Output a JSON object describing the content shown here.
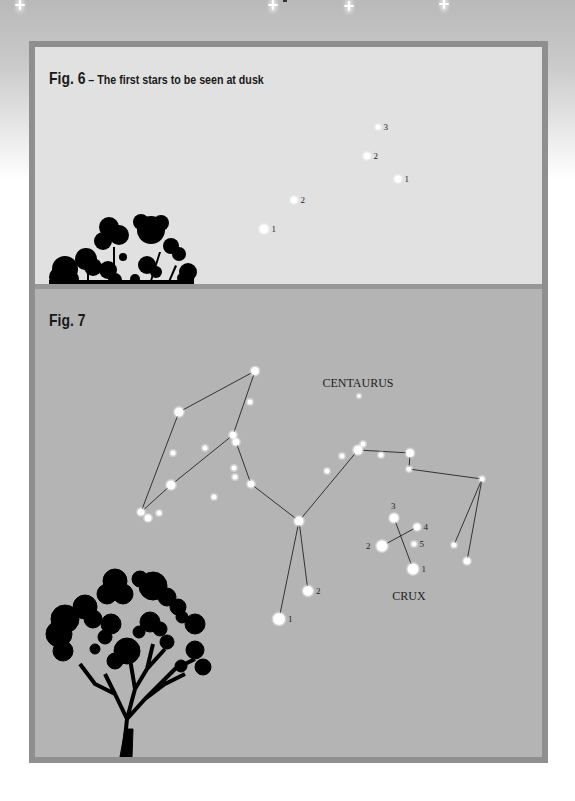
{
  "page": {
    "background_colors": {
      "top": "#b9b9b9",
      "bottom": "#ffffff"
    },
    "sparkles": [
      {
        "x": 15,
        "y": 0
      },
      {
        "x": 268,
        "y": 0
      },
      {
        "x": 344,
        "y": 1
      },
      {
        "x": 439,
        "y": -1
      }
    ]
  },
  "fig6": {
    "label": "Fig. 6",
    "separator": " – ",
    "subtitle": "The first stars to be seen at dusk",
    "fill": "#e1e1e1",
    "stars": [
      {
        "x": 229,
        "y": 182,
        "r": 4.5,
        "label": "1"
      },
      {
        "x": 259,
        "y": 153,
        "r": 3.5,
        "label": "2"
      },
      {
        "x": 332,
        "y": 109,
        "r": 3.5,
        "label": "2"
      },
      {
        "x": 363,
        "y": 132,
        "r": 3.5,
        "label": "1"
      },
      {
        "x": 343,
        "y": 80,
        "r": 2.5,
        "label": "3"
      }
    ]
  },
  "fig7": {
    "label": "Fig. 7",
    "fill": "#b4b4b4",
    "constellations": [
      {
        "name": "CENTAURUS",
        "label_x": 323,
        "label_y": 98
      },
      {
        "name": "CRUX",
        "label_x": 374,
        "label_y": 311
      }
    ],
    "stars": [
      {
        "x": 220,
        "y": 82,
        "r": 4
      },
      {
        "x": 144,
        "y": 123,
        "r": 4.5
      },
      {
        "x": 198,
        "y": 146,
        "r": 3.5
      },
      {
        "x": 201,
        "y": 153,
        "r": 3.5
      },
      {
        "x": 136,
        "y": 196,
        "r": 4.5
      },
      {
        "x": 106,
        "y": 223,
        "r": 3.5
      },
      {
        "x": 113,
        "y": 229,
        "r": 3.5
      },
      {
        "x": 124,
        "y": 224,
        "r": 2.5
      },
      {
        "x": 216,
        "y": 195,
        "r": 3.5
      },
      {
        "x": 264,
        "y": 232,
        "r": 4.5
      },
      {
        "x": 215,
        "y": 113,
        "r": 2.5
      },
      {
        "x": 138,
        "y": 164,
        "r": 2.5
      },
      {
        "x": 170,
        "y": 159,
        "r": 2.5
      },
      {
        "x": 199,
        "y": 179,
        "r": 2.5
      },
      {
        "x": 200,
        "y": 188,
        "r": 2.5
      },
      {
        "x": 179,
        "y": 208,
        "r": 2.5
      },
      {
        "x": 324,
        "y": 107,
        "r": 1.8
      },
      {
        "x": 323,
        "y": 161,
        "r": 4.5
      },
      {
        "x": 328,
        "y": 155,
        "r": 2.5
      },
      {
        "x": 375,
        "y": 164,
        "r": 4
      },
      {
        "x": 374,
        "y": 180,
        "r": 2.5
      },
      {
        "x": 447,
        "y": 190,
        "r": 2.5
      },
      {
        "x": 307,
        "y": 167,
        "r": 2.5
      },
      {
        "x": 346,
        "y": 166,
        "r": 2.5
      },
      {
        "x": 292,
        "y": 182,
        "r": 2.5
      },
      {
        "x": 419,
        "y": 256,
        "r": 2.5
      },
      {
        "x": 432,
        "y": 272,
        "r": 3.5
      },
      {
        "x": 273,
        "y": 302,
        "r": 5,
        "label": "2"
      },
      {
        "x": 244,
        "y": 330,
        "r": 6,
        "label": "1"
      },
      {
        "x": 359,
        "y": 229,
        "r": 4.5,
        "label": "3"
      },
      {
        "x": 382,
        "y": 238,
        "r": 3.5,
        "label": "4"
      },
      {
        "x": 347,
        "y": 257,
        "r": 5.5,
        "label": "2"
      },
      {
        "x": 379,
        "y": 255,
        "r": 2.5,
        "label": "5"
      },
      {
        "x": 378,
        "y": 280,
        "r": 5.5,
        "label": "1"
      }
    ],
    "lines": [
      [
        [
          220,
          82
        ],
        [
          144,
          123
        ],
        [
          106,
          223
        ]
      ],
      [
        [
          220,
          82
        ],
        [
          198,
          146
        ]
      ],
      [
        [
          198,
          146
        ],
        [
          136,
          196
        ],
        [
          106,
          223
        ]
      ],
      [
        [
          201,
          153
        ],
        [
          216,
          195
        ],
        [
          264,
          232
        ]
      ],
      [
        [
          264,
          232
        ],
        [
          323,
          161
        ],
        [
          375,
          164
        ],
        [
          374,
          180
        ],
        [
          447,
          190
        ]
      ],
      [
        [
          264,
          232
        ],
        [
          273,
          302
        ]
      ],
      [
        [
          264,
          232
        ],
        [
          244,
          330
        ]
      ],
      [
        [
          447,
          190
        ],
        [
          419,
          256
        ]
      ],
      [
        [
          447,
          190
        ],
        [
          432,
          272
        ]
      ],
      [
        [
          359,
          229
        ],
        [
          378,
          280
        ]
      ],
      [
        [
          347,
          257
        ],
        [
          382,
          238
        ]
      ]
    ]
  }
}
